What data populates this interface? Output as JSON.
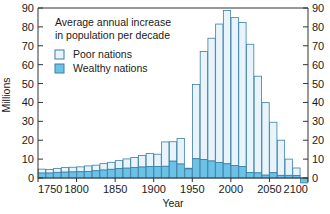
{
  "chart_data": {
    "type": "bar",
    "title": "",
    "xlabel": "Year",
    "ylabel": "Millions",
    "xlim": [
      1750,
      2100
    ],
    "ylim": [
      -3,
      90
    ],
    "ytick_labels": [
      "0",
      "10",
      "20",
      "30",
      "40",
      "50",
      "60",
      "70",
      "80",
      "90"
    ],
    "ytick_values": [
      0,
      10,
      20,
      30,
      40,
      50,
      60,
      70,
      80,
      90
    ],
    "xtick_labels": [
      "1750",
      "1800",
      "1850",
      "1900",
      "1950",
      "2000",
      "2050",
      "2100"
    ],
    "xtick_values": [
      1750,
      1800,
      1850,
      1900,
      1950,
      2000,
      2050,
      2100
    ],
    "grid": false,
    "stacked": true,
    "legend_position": "upper-left-inside",
    "annotation": {
      "line1": "Average annual increase",
      "line2": "in population per decade"
    },
    "legend": [
      {
        "name": "Poor nations",
        "color": "#e8f4fa"
      },
      {
        "name": "Wealthy nations",
        "color": "#6cc2e6"
      }
    ],
    "categories": [
      1750,
      1760,
      1770,
      1780,
      1790,
      1800,
      1810,
      1820,
      1830,
      1840,
      1850,
      1860,
      1870,
      1880,
      1890,
      1900,
      1910,
      1920,
      1930,
      1940,
      1950,
      1960,
      1970,
      1980,
      1990,
      2000,
      2010,
      2020,
      2030,
      2040,
      2050,
      2060,
      2070,
      2080,
      2090
    ],
    "series": [
      {
        "name": "Wealthy nations",
        "color": "#6cc2e6",
        "values": [
          2.6,
          2.6,
          3.0,
          3.1,
          3.2,
          3.3,
          3.5,
          3.8,
          4.2,
          4.6,
          5.0,
          5.2,
          5.6,
          5.8,
          6.0,
          6.1,
          6.2,
          8.9,
          7.4,
          4.8,
          10.2,
          9.8,
          9.0,
          8.2,
          7.5,
          6.6,
          6.1,
          2.9,
          2.7,
          1.5,
          2.8,
          1.4,
          1.4,
          1.3,
          -2.6
        ]
      },
      {
        "name": "Poor nations",
        "color": "#e8f4fa",
        "values": [
          2.1,
          1.9,
          2.0,
          2.4,
          2.5,
          2.6,
          2.9,
          3.0,
          3.4,
          3.7,
          4.2,
          4.9,
          5.3,
          6.1,
          7.0,
          6.5,
          12.9,
          10.3,
          13.5,
          0.4,
          39.3,
          57.2,
          65.0,
          73.3,
          81.2,
          78.3,
          76.2,
          67.9,
          51.2,
          38.4,
          26.7,
          18.6,
          8.6,
          4.0,
          0.0
        ]
      }
    ],
    "totals": [
      4.7,
      4.5,
      5.0,
      5.5,
      5.7,
      5.9,
      6.4,
      6.8,
      7.6,
      8.3,
      9.2,
      10.1,
      10.9,
      11.9,
      13.0,
      12.6,
      19.1,
      19.2,
      20.9,
      5.2,
      49.5,
      67.0,
      74.0,
      81.5,
      88.7,
      84.9,
      82.3,
      70.8,
      53.9,
      39.9,
      29.5,
      20.0,
      10.0,
      5.3,
      -2.6
    ]
  }
}
